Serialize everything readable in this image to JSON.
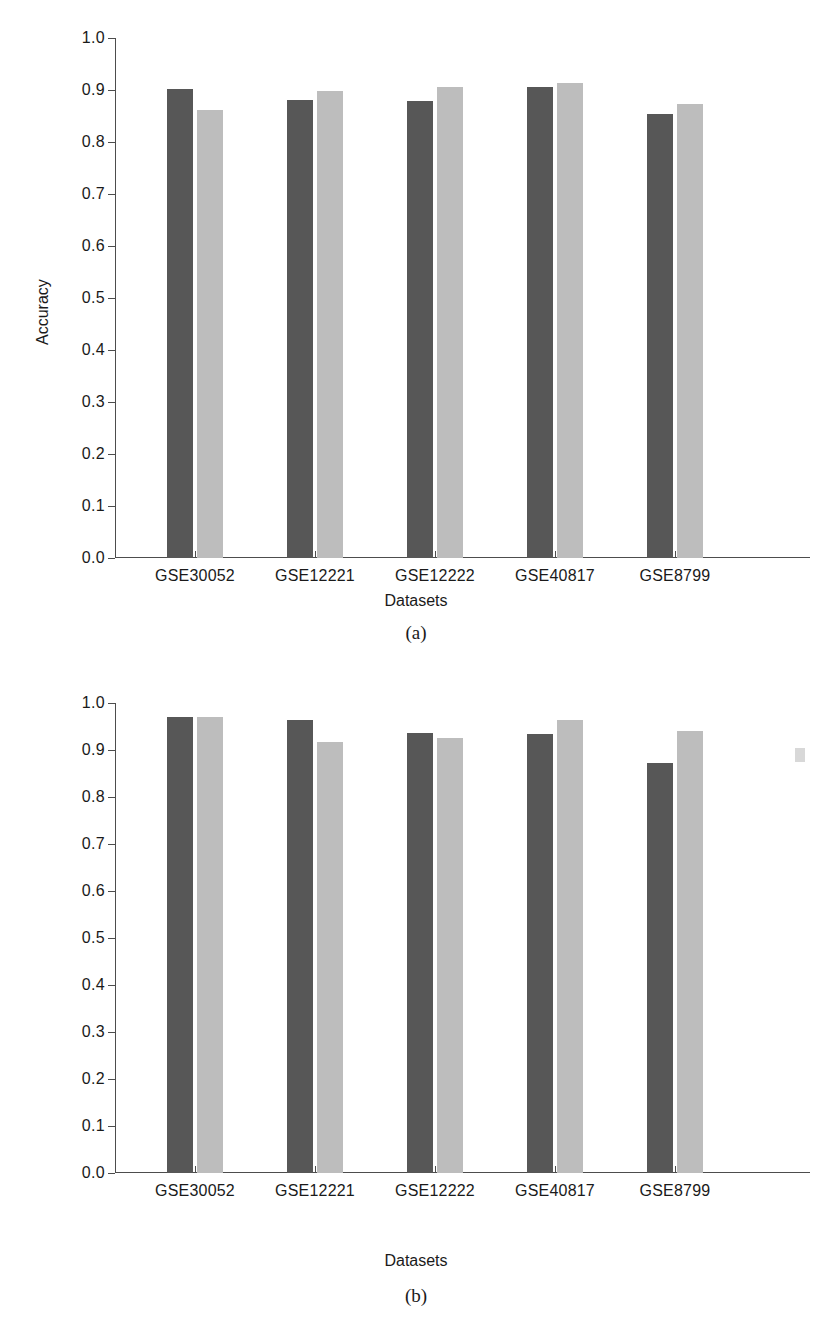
{
  "figures": [
    {
      "id": "a",
      "caption": "(a)",
      "xlabel": "Datasets",
      "ylabel": "Accuracy"
    },
    {
      "id": "b",
      "caption": "(b)",
      "xlabel": "Datasets",
      "ylabel": "Accuracy"
    }
  ],
  "colors": {
    "series_0": "#575757",
    "series_1": "#bdbdbd",
    "axis": "#4d4d4d",
    "background": "#ffffff"
  },
  "axis": {
    "y_ticks": [
      "0.0",
      "0.1",
      "0.2",
      "0.3",
      "0.4",
      "0.5",
      "0.6",
      "0.7",
      "0.8",
      "0.9",
      "1.0"
    ]
  },
  "chart_data": [
    {
      "type": "bar",
      "panel": "(a)",
      "title": "",
      "xlabel": "Datasets",
      "ylabel": "Accuracy",
      "ylim": [
        0.0,
        1.0
      ],
      "yticks": [
        0.0,
        0.1,
        0.2,
        0.3,
        0.4,
        0.5,
        0.6,
        0.7,
        0.8,
        0.9,
        1.0
      ],
      "grid": false,
      "legend": "none",
      "categories": [
        "GSE30052",
        "GSE12221",
        "GSE12222",
        "GSE40817",
        "GSE8799"
      ],
      "series": [
        {
          "name": "series-1",
          "values": [
            0.901,
            0.881,
            0.878,
            0.906,
            0.854
          ]
        },
        {
          "name": "series-2",
          "values": [
            0.862,
            0.899,
            0.906,
            0.913,
            0.873
          ]
        }
      ]
    },
    {
      "type": "bar",
      "panel": "(b)",
      "title": "",
      "xlabel": "Datasets",
      "ylabel": "Accuracy",
      "ylim": [
        0.0,
        1.0
      ],
      "yticks": [
        0.0,
        0.1,
        0.2,
        0.3,
        0.4,
        0.5,
        0.6,
        0.7,
        0.8,
        0.9,
        1.0
      ],
      "grid": false,
      "legend": "none",
      "categories": [
        "GSE30052",
        "GSE12221",
        "GSE12222",
        "GSE40817",
        "GSE8799"
      ],
      "series": [
        {
          "name": "series-1",
          "values": [
            0.971,
            0.964,
            0.937,
            0.934,
            0.872
          ]
        },
        {
          "name": "series-2",
          "values": [
            0.97,
            0.917,
            0.925,
            0.964,
            0.941
          ]
        }
      ]
    }
  ]
}
